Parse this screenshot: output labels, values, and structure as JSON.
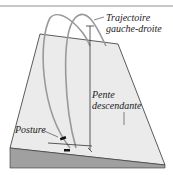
{
  "diagram": {
    "labels": {
      "trajectory": [
        "Trajectoire",
        "gauche-droite"
      ],
      "slope": [
        "Pente",
        "descendante"
      ],
      "posture": "Posture"
    },
    "colors": {
      "plane": "#e8e8e8",
      "ground": "#9a9a9a",
      "arc": "#9a9a9a",
      "line": "#222222"
    }
  }
}
